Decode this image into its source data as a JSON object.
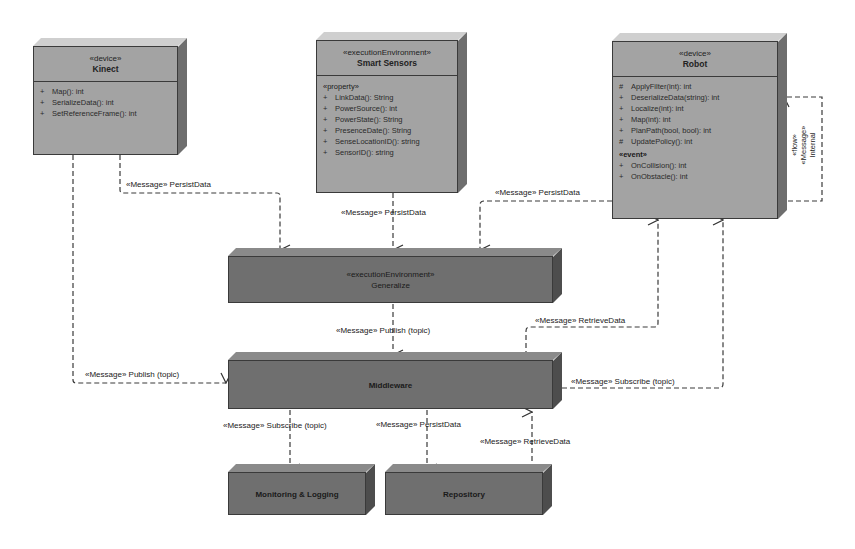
{
  "nodes": {
    "kinect": {
      "stereotype": "«device»",
      "name": "Kinect",
      "operations": [
        {
          "vis": "+",
          "text": "Map(): int"
        },
        {
          "vis": "+",
          "text": "SerializeData(): int"
        },
        {
          "vis": "+",
          "text": "SetReferenceFrame(): int"
        }
      ]
    },
    "smart_sensors": {
      "stereotype": "«executionEnvironment»",
      "name": "Smart Sensors",
      "section": "«property»",
      "operations": [
        {
          "vis": "+",
          "text": "LinkData(): String"
        },
        {
          "vis": "+",
          "text": "PowerSource(): int"
        },
        {
          "vis": "+",
          "text": "PowerState(): String"
        },
        {
          "vis": "+",
          "text": "PresenceDate(): String"
        },
        {
          "vis": "+",
          "text": "SenseLocationID(): string"
        },
        {
          "vis": "+",
          "text": "SensorID(): string"
        }
      ]
    },
    "robot": {
      "stereotype": "«device»",
      "name": "Robot",
      "operations": [
        {
          "vis": "#",
          "text": "ApplyFilter(int): int"
        },
        {
          "vis": "+",
          "text": "DeserializeData(string): int"
        },
        {
          "vis": "+",
          "text": "Localize(int): int"
        },
        {
          "vis": "+",
          "text": "Map(int): int"
        },
        {
          "vis": "+",
          "text": "PlanPath(bool, bool): int"
        },
        {
          "vis": "#",
          "text": "UpdatePolicy(): int"
        }
      ],
      "event_section": "«event»",
      "events": [
        {
          "vis": "+",
          "text": "OnCollision(): int"
        },
        {
          "vis": "+",
          "text": "OnObstacle(): int"
        }
      ]
    },
    "generalize": {
      "stereotype": "«executionEnvironment»",
      "name": "Generalize"
    },
    "middleware": {
      "name": "Middleware"
    },
    "monitoring": {
      "name": "Monitoring & Logging"
    },
    "repository": {
      "name": "Repository"
    }
  },
  "edges": {
    "kinect_persist": "«Message» PersistData",
    "sensors_persist": "«Message» PersistData",
    "robot_persist": "«Message» PersistData",
    "generalize_publish": "«Message» Publish (topic)",
    "kinect_publish": "«Message» Publish (topic)",
    "middleware_retrieve": "«Message» RetrieveData",
    "middleware_subscribe_robot": "«Message» Subscribe (topic)",
    "middleware_subscribe_monitoring": "«Message» Subscribe (topic)",
    "middleware_persist_repo": "«Message» PersistData",
    "repo_retrieve": "«Message» RetrieveData",
    "robot_internal": {
      "line1": "«flow»",
      "line2": "«Message»",
      "line3": "Internal"
    }
  }
}
